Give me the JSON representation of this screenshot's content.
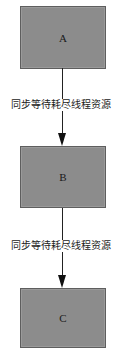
{
  "diagram": {
    "type": "flowchart",
    "direction": "top-to-bottom",
    "colors": {
      "node_fill": "#8c8c8c",
      "node_border": "#5e5e5e",
      "edge": "#222222",
      "text": "#222222"
    },
    "nodes": [
      {
        "id": "A",
        "label": "A"
      },
      {
        "id": "B",
        "label": "B"
      },
      {
        "id": "C",
        "label": "C"
      }
    ],
    "edges": [
      {
        "from": "A",
        "to": "B",
        "label": "同步等待耗尽线程资源"
      },
      {
        "from": "B",
        "to": "C",
        "label": "同步等待耗尽线程资源"
      }
    ]
  }
}
